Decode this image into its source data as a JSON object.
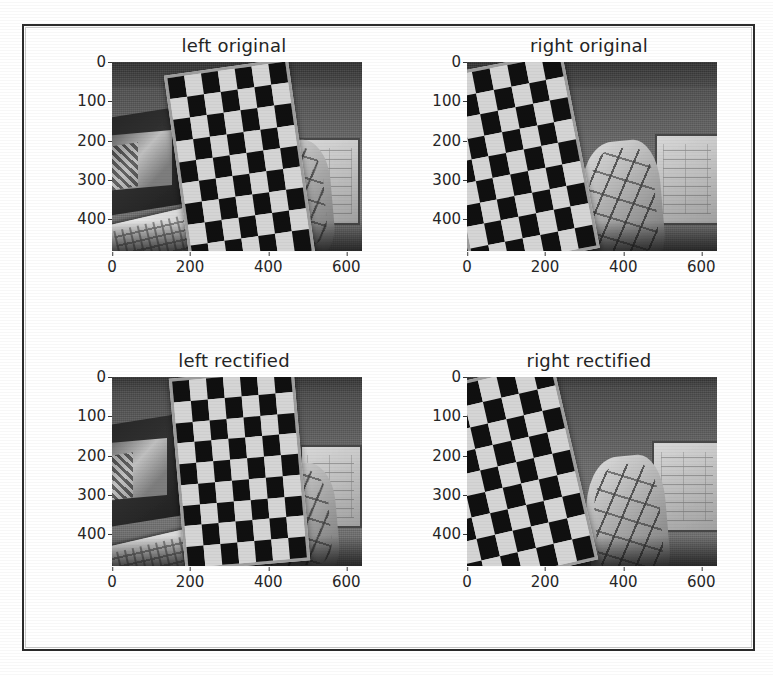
{
  "figure": {
    "layout": "2x2 subplot grid",
    "background_color": "#ffffff",
    "border_color": "#2b2b2b"
  },
  "chart_data": {
    "type": "image-grid",
    "title": "",
    "rows": 2,
    "cols": 2,
    "shared_xlabel": "",
    "shared_ylabel": "",
    "xlim": [
      0,
      640
    ],
    "ylim": [
      480,
      0
    ],
    "grid": false,
    "legend": null,
    "xtick_labels": [
      "0",
      "200",
      "400",
      "600"
    ],
    "ytick_labels": [
      "0",
      "100",
      "200",
      "300",
      "400"
    ],
    "xticks": [
      0,
      200,
      400,
      600
    ],
    "yticks": [
      0,
      100,
      200,
      300,
      400
    ],
    "panels": [
      {
        "id": "left-original",
        "title": "left original",
        "row": 0,
        "col": 0,
        "content": "grayscale photo of a tilted checkerboard calibration target in an office scene",
        "board_cols": 7,
        "board_rows": 9,
        "board_rotation_deg": -8
      },
      {
        "id": "right-original",
        "title": "right original",
        "row": 0,
        "col": 1,
        "content": "grayscale photo of a tilted checkerboard calibration target in an office scene",
        "board_cols": 7,
        "board_rows": 9,
        "board_rotation_deg": -11
      },
      {
        "id": "left-rectified",
        "title": "left rectified",
        "row": 1,
        "col": 0,
        "content": "grayscale rectified photo of the checkerboard calibration target",
        "board_cols": 7,
        "board_rows": 9,
        "board_rotation_deg": -5
      },
      {
        "id": "right-rectified",
        "title": "right rectified",
        "row": 1,
        "col": 1,
        "content": "grayscale rectified photo of the checkerboard calibration target",
        "board_cols": 7,
        "board_rows": 9,
        "board_rotation_deg": -13
      }
    ]
  }
}
